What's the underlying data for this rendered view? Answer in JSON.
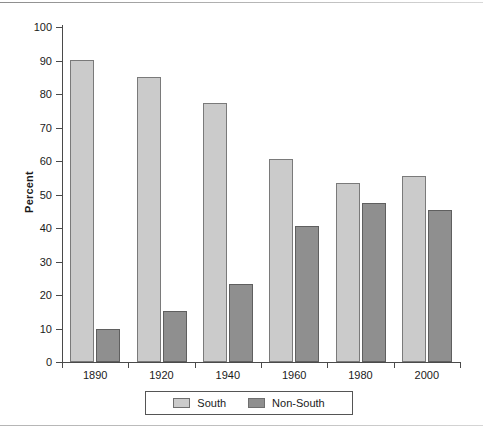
{
  "chart_data": {
    "type": "bar",
    "title": "",
    "subtitle": "",
    "xlabel": "",
    "ylabel": "Percent",
    "categories": [
      "1890",
      "1920",
      "1940",
      "1960",
      "1980",
      "2000"
    ],
    "series": [
      {
        "name": "South",
        "color": "#cbcbcb",
        "values": [
          90.3,
          85.2,
          77.3,
          60.5,
          53.5,
          55.5
        ]
      },
      {
        "name": "Non-South",
        "color": "#8f8f8f",
        "values": [
          10.0,
          15.2,
          23.3,
          40.5,
          47.5,
          45.5
        ]
      }
    ],
    "ylim": [
      0,
      100
    ],
    "y_ticks": [
      0,
      10,
      20,
      30,
      40,
      50,
      60,
      70,
      80,
      90,
      100
    ],
    "y_tick_labels": [
      "0",
      "10",
      "20",
      "30",
      "40",
      "50",
      "60",
      "70",
      "80",
      "90",
      "100"
    ],
    "grid": false,
    "legend_position": "bottom",
    "legend_entries": [
      "South",
      "Non-South"
    ]
  },
  "axis": {
    "y_title": "Percent"
  }
}
